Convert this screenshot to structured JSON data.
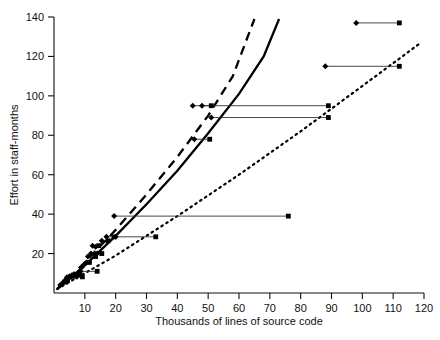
{
  "chart_data": {
    "type": "scatter",
    "title": "",
    "xlabel": "Thousands of lines of source code",
    "ylabel": "Effort in staff-months",
    "xlim": [
      0,
      120
    ],
    "ylim": [
      0,
      140
    ],
    "xticks": [
      10,
      20,
      30,
      40,
      50,
      60,
      70,
      80,
      90,
      100,
      110,
      120
    ],
    "yticks": [
      20,
      40,
      60,
      80,
      100,
      120,
      140
    ],
    "grid": false,
    "legend": "none",
    "series": [
      {
        "name": "Project pairs (estimate to actual)",
        "marker_start": "diamond",
        "marker_end": "square",
        "connector": "horizontal-line",
        "points": [
          {
            "x_start": 2.0,
            "x_end": 2.0,
            "y": 4.0
          },
          {
            "x_start": 3.0,
            "x_end": 3.6,
            "y": 5.5
          },
          {
            "x_start": 3.6,
            "x_end": 4.4,
            "y": 6.5
          },
          {
            "x_start": 4.2,
            "x_end": 5.2,
            "y": 8.0
          },
          {
            "x_start": 5.0,
            "x_end": 6.4,
            "y": 8.5
          },
          {
            "x_start": 5.8,
            "x_end": 7.2,
            "y": 9.0
          },
          {
            "x_start": 6.6,
            "x_end": 8.4,
            "y": 9.5
          },
          {
            "x_start": 7.4,
            "x_end": 9.2,
            "y": 8.2
          },
          {
            "x_start": 8.6,
            "x_end": 14.0,
            "y": 11.0
          },
          {
            "x_start": 9.0,
            "x_end": 9.0,
            "y": 13.0
          },
          {
            "x_start": 10.5,
            "x_end": 11.5,
            "y": 15.5
          },
          {
            "x_start": 11.0,
            "x_end": 13.5,
            "y": 18.5
          },
          {
            "x_start": 12.0,
            "x_end": 12.0,
            "y": 20.0
          },
          {
            "x_start": 12.5,
            "x_end": 14.5,
            "y": 24.0
          },
          {
            "x_start": 13.5,
            "x_end": 13.5,
            "y": 23.5
          },
          {
            "x_start": 14.0,
            "x_end": 15.5,
            "y": 20.0
          },
          {
            "x_start": 15.5,
            "x_end": 17.5,
            "y": 26.5
          },
          {
            "x_start": 17.0,
            "x_end": 19.5,
            "y": 28.5
          },
          {
            "x_start": 19.5,
            "x_end": 76.0,
            "y": 39.0
          },
          {
            "x_start": 20.0,
            "x_end": 33.0,
            "y": 28.5
          },
          {
            "x_start": 45.0,
            "x_end": 51.0,
            "y": 95.0
          },
          {
            "x_start": 48.0,
            "x_end": 89.0,
            "y": 95.0
          },
          {
            "x_start": 51.0,
            "x_end": 89.0,
            "y": 89.0
          },
          {
            "x_start": 45.5,
            "x_end": 50.5,
            "y": 78.0
          },
          {
            "x_start": 88.0,
            "x_end": 112.0,
            "y": 115.0
          },
          {
            "x_start": 98.0,
            "x_end": 112.0,
            "y": 137.0
          }
        ]
      }
    ],
    "curves": [
      {
        "name": "solid-model-curve",
        "style": "solid",
        "points": [
          {
            "x": 1.0,
            "y": 2.0
          },
          {
            "x": 10.0,
            "y": 14.0
          },
          {
            "x": 20.0,
            "y": 29.0
          },
          {
            "x": 30.0,
            "y": 45.0
          },
          {
            "x": 40.0,
            "y": 62.0
          },
          {
            "x": 50.0,
            "y": 81.0
          },
          {
            "x": 60.0,
            "y": 101.0
          },
          {
            "x": 68.0,
            "y": 120.0
          },
          {
            "x": 73.0,
            "y": 139.0
          }
        ]
      },
      {
        "name": "dashed-model-curve",
        "style": "dashed",
        "points": [
          {
            "x": 1.0,
            "y": 2.0
          },
          {
            "x": 10.0,
            "y": 15.5
          },
          {
            "x": 20.0,
            "y": 32.0
          },
          {
            "x": 30.0,
            "y": 50.0
          },
          {
            "x": 40.0,
            "y": 69.0
          },
          {
            "x": 50.0,
            "y": 90.0
          },
          {
            "x": 58.0,
            "y": 110.0
          },
          {
            "x": 65.0,
            "y": 139.0
          }
        ]
      },
      {
        "name": "dotted-model-curve",
        "style": "dotted",
        "points": [
          {
            "x": 1.0,
            "y": 2.0
          },
          {
            "x": 20.0,
            "y": 19.0
          },
          {
            "x": 40.0,
            "y": 39.0
          },
          {
            "x": 60.0,
            "y": 60.0
          },
          {
            "x": 80.0,
            "y": 82.0
          },
          {
            "x": 100.0,
            "y": 105.0
          },
          {
            "x": 119.0,
            "y": 127.0
          }
        ]
      }
    ]
  }
}
